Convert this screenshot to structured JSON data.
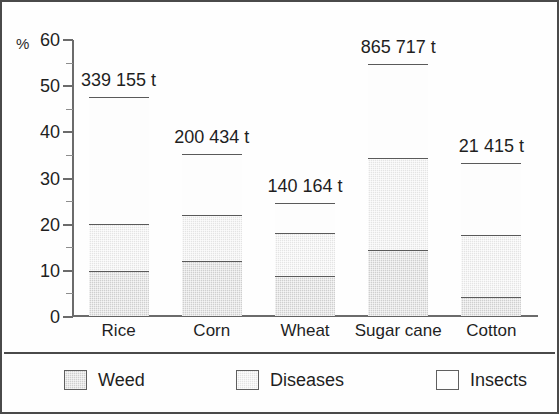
{
  "chart_data": {
    "type": "bar",
    "subtype": "stacked-bar",
    "title": "",
    "xlabel": "",
    "ylabel": "%",
    "ylim": [
      0,
      60
    ],
    "ytick_step": 10,
    "yminor_step": 5,
    "grid": false,
    "legend_position": "bottom",
    "categories": [
      "Rice",
      "Corn",
      "Wheat",
      "Sugar cane",
      "Cotton"
    ],
    "ytick_labels": [
      "60",
      "50",
      "40",
      "30",
      "20",
      "10",
      "0"
    ],
    "ytick_values": [
      60,
      50,
      40,
      30,
      20,
      10,
      0
    ],
    "series": [
      {
        "name": "Weed",
        "values": [
          9.7,
          12.0,
          8.6,
          14.3,
          4.2
        ]
      },
      {
        "name": "Diseases",
        "values": [
          10.3,
          9.8,
          9.4,
          20.0,
          13.4
        ]
      },
      {
        "name": "Insects",
        "values": [
          27.5,
          13.2,
          6.4,
          20.2,
          15.6
        ]
      }
    ],
    "totals": [
      47.5,
      35.0,
      24.4,
      54.5,
      33.2
    ],
    "bar_labels": [
      "339 155 t",
      "200 434 t",
      "140 164 t",
      "865 717 t",
      "21 415 t"
    ],
    "annotations": [
      "Values above each bar are absolute tonnages",
      "Bar height is percent share"
    ],
    "colors": {
      "weed": "#cfcfcf",
      "diseases": "#e4e4e4",
      "insects": "#fdfdfd",
      "outline": "#636363",
      "axis": "#6b6b6b",
      "text": "#1f1f1f",
      "frame": "#4a4a4a",
      "background": "#fefefe"
    }
  },
  "axis": {
    "y_unit_label": "%"
  },
  "legend": {
    "items": [
      {
        "label": "Weed",
        "swatch": "weed-swatch"
      },
      {
        "label": "Diseases",
        "swatch": "diseases-swatch"
      },
      {
        "label": "Insects",
        "swatch": "insects-swatch"
      }
    ]
  }
}
